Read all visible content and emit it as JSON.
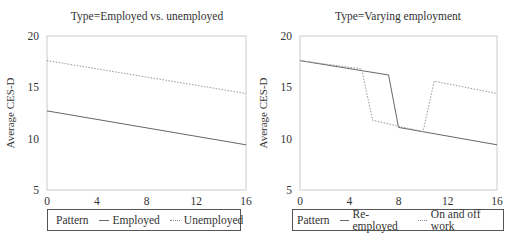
{
  "chart_data": [
    {
      "type": "line",
      "title": "Type=Employed vs. unemployed",
      "xlabel": "Time (in months)",
      "ylabel": "Average CES-D",
      "xlim": [
        0,
        16
      ],
      "ylim": [
        5,
        20
      ],
      "xticks": [
        0,
        4,
        8,
        12,
        16
      ],
      "yticks": [
        5,
        10,
        15,
        20
      ],
      "grid": false,
      "legend": {
        "title": "Pattern",
        "position": "bottom"
      },
      "series": [
        {
          "name": "Employed",
          "style": "solid",
          "points": [
            [
              0,
              12.7
            ],
            [
              16,
              9.4
            ]
          ]
        },
        {
          "name": "Unemployed",
          "style": "dotted",
          "points": [
            [
              0,
              17.6
            ],
            [
              16,
              14.4
            ]
          ]
        }
      ]
    },
    {
      "type": "line",
      "title": "Type=Varying employment",
      "xlabel": "Time (in months)",
      "ylabel": "Average CES-D",
      "xlim": [
        0,
        16
      ],
      "ylim": [
        5,
        20
      ],
      "xticks": [
        0,
        4,
        8,
        12,
        16
      ],
      "yticks": [
        5,
        10,
        15,
        20
      ],
      "grid": false,
      "legend": {
        "title": "Pattern",
        "position": "bottom"
      },
      "series": [
        {
          "name": "Re-employed",
          "style": "solid",
          "points": [
            [
              0,
              17.6
            ],
            [
              7.2,
              16.2
            ],
            [
              8,
              11.1
            ],
            [
              16,
              9.4
            ]
          ]
        },
        {
          "name": "On and off work",
          "style": "dotted",
          "points": [
            [
              0,
              17.6
            ],
            [
              5,
              16.8
            ],
            [
              5.9,
              11.8
            ],
            [
              8,
              11.2
            ],
            [
              10,
              10.7
            ],
            [
              10.9,
              15.6
            ],
            [
              16,
              14.4
            ]
          ]
        }
      ]
    }
  ],
  "panels": [
    {
      "title": "Type=Employed vs. unemployed",
      "ylabel": "Average CES-D",
      "xlabel": "Time (in months)",
      "legend": {
        "title": "Pattern",
        "items": [
          "Employed",
          "Unemployed"
        ]
      }
    },
    {
      "title": "Type=Varying employment",
      "ylabel": "Average CES-D",
      "xlabel": "Time (in months)",
      "legend": {
        "title": "Pattern",
        "items": [
          "Re-employed",
          "On and off work"
        ]
      }
    }
  ],
  "colors": {
    "solid": "#666666",
    "dotted": "#999999",
    "frame": "#cccccc"
  }
}
